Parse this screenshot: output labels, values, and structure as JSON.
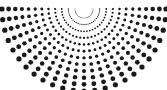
{
  "figure": {
    "width": 167,
    "height": 90,
    "background_color": "#ffffff",
    "dot_color": "#1a1a1a"
  },
  "chart_data": {
    "type": "scatter",
    "subtitle": "",
    "xlabel": "",
    "ylabel": "",
    "xlim": [
      0,
      167
    ],
    "ylim": [
      0,
      90
    ],
    "grid": false,
    "legend": null,
    "annotations": [],
    "tick_labels": {
      "x": [],
      "y": []
    },
    "geometry": {
      "coordinate_system": "polar",
      "center_x": 84,
      "center_y": 9,
      "angle_start_deg": 180,
      "angle_end_deg": 0,
      "angle_step_deg": 7.5,
      "ray_count": 25,
      "radius_min": 9,
      "radius_max": 82,
      "radius_step": 6.6,
      "dots_per_ray": 12,
      "dot_radius_min": 0.45,
      "dot_radius_max": 2.6,
      "dot_color": "#1a1a1a"
    },
    "series": [
      {
        "name": "fan-dots",
        "marker": "circle",
        "color": "#1a1a1a",
        "point_count": 300
      }
    ]
  }
}
